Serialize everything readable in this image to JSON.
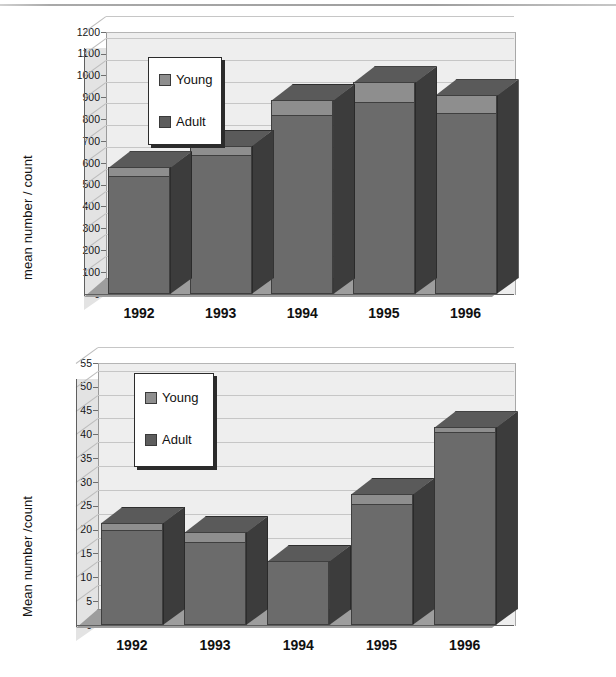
{
  "figure": {
    "panels": [
      {
        "id": "top-chart",
        "ylabel": "mean number / count",
        "legend": {
          "items": [
            {
              "label": "Young"
            },
            {
              "label": "Adult"
            }
          ]
        },
        "chart_data": {
          "type": "bar",
          "subtype": "stacked-3d-column",
          "title": "",
          "xlabel": "",
          "ylabel": "mean number / count",
          "ylim": [
            0,
            1200
          ],
          "ytick_step": 100,
          "yticks": [
            0,
            100,
            200,
            300,
            400,
            500,
            600,
            700,
            800,
            900,
            1000,
            1100,
            1200
          ],
          "grid": true,
          "legend_position": "upper-left-inside",
          "categories": [
            "1992",
            "1993",
            "1994",
            "1995",
            "1996"
          ],
          "series": [
            {
              "name": "Adult",
              "values": [
                540,
                635,
                820,
                880,
                830
              ]
            },
            {
              "name": "Young",
              "values": [
                40,
                45,
                70,
                90,
                80
              ]
            }
          ],
          "totals": [
            580,
            680,
            890,
            970,
            910
          ]
        }
      },
      {
        "id": "bottom-chart",
        "ylabel": "Mean number /count",
        "legend": {
          "items": [
            {
              "label": "Young"
            },
            {
              "label": "Adult"
            }
          ]
        },
        "chart_data": {
          "type": "bar",
          "subtype": "stacked-3d-column",
          "title": "",
          "xlabel": "",
          "ylabel": "Mean number /count",
          "ylim": [
            0,
            55
          ],
          "ytick_step": 5,
          "yticks": [
            0,
            5,
            10,
            15,
            20,
            25,
            30,
            35,
            40,
            45,
            50,
            55
          ],
          "grid": true,
          "legend_position": "upper-left-inside",
          "categories": [
            "1992",
            "1993",
            "1994",
            "1995",
            "1996"
          ],
          "series": [
            {
              "name": "Adult",
              "values": [
                20,
                17.5,
                13.5,
                25.5,
                40.5
              ]
            },
            {
              "name": "Young",
              "values": [
                1.5,
                2,
                0,
                2,
                1
              ]
            }
          ],
          "totals": [
            21.5,
            19.5,
            13.5,
            27.5,
            41.5
          ]
        }
      }
    ]
  },
  "colors": {
    "adult": "#6b6b6b",
    "young": "#8e8e8e",
    "bar_side": "#3c3c3c",
    "plot_background": "#eeeeee",
    "side_wall": "#e3e3e3",
    "floor": "#9d9d9d",
    "gridline": "#c6c6c6",
    "text": "#141414"
  },
  "tick_labels": {
    "top": [
      "1200",
      "1100",
      "1000",
      "900",
      "800",
      "700",
      "600",
      "500",
      "400",
      "300",
      "200",
      "100",
      "0"
    ],
    "bottom": [
      "55",
      "50",
      "45",
      "40",
      "35",
      "30",
      "25",
      "20",
      "15",
      "10",
      "5",
      "0"
    ]
  },
  "x_labels": [
    "1992",
    "1993",
    "1994",
    "1995",
    "1996"
  ]
}
